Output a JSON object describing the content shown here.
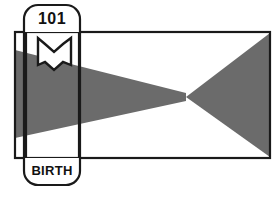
{
  "canvas": {
    "width": 277,
    "height": 200,
    "background_color": "#ffffff"
  },
  "colors": {
    "stroke": "#1a1a1a",
    "fill_gray": "#6b6b6b",
    "fill_white": "#ffffff",
    "text": "#111111"
  },
  "frame": {
    "name": "outer-rectangle",
    "x": 15,
    "y": 32,
    "width": 255,
    "height": 126,
    "stroke_width": 2.2
  },
  "marker": {
    "name": "vertical-rounded-label",
    "x": 24,
    "y": 5,
    "width": 56,
    "height": 180,
    "corner_radius": 14,
    "stroke_width": 2.2,
    "top_label": "101",
    "bottom_label": "BIRTH"
  },
  "icon": {
    "name": "open-book-icon",
    "x": 38,
    "y": 38,
    "width": 33,
    "height": 33,
    "stroke_width": 2.4
  },
  "shape": {
    "name": "bowtie-gray-region",
    "description": "Hourglass / bowtie shaded region spanning the rectangle, pinching near the right-center.",
    "fill": "#6b6b6b",
    "pinch_point": {
      "x": 186,
      "y": 97
    },
    "left_wedge": [
      {
        "x": 15,
        "y": 50
      },
      {
        "x": 186,
        "y": 93
      },
      {
        "x": 186,
        "y": 101
      },
      {
        "x": 15,
        "y": 138
      }
    ],
    "right_wedge": [
      {
        "x": 186,
        "y": 97
      },
      {
        "x": 270,
        "y": 33
      },
      {
        "x": 270,
        "y": 157
      }
    ]
  },
  "inner_lines": {
    "name": "label-column-guides",
    "left_x": 26,
    "right_x": 79,
    "top_y": 33,
    "bottom_y": 157
  }
}
